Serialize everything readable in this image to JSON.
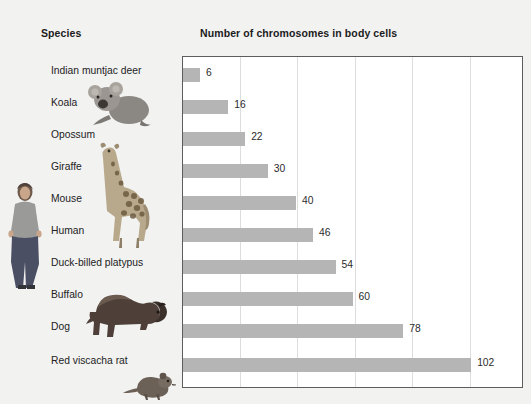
{
  "headers": {
    "species": "Species",
    "chart": "Number of chromosomes in body cells"
  },
  "chart_data": {
    "type": "bar",
    "orientation": "horizontal",
    "title": "Number of chromosomes in body cells",
    "xlabel": "",
    "ylabel": "Species",
    "categories": [
      "Indian muntjac deer",
      "Koala",
      "Opossum",
      "Giraffe",
      "Mouse",
      "Human",
      "Duck-billed platypus",
      "Buffalo",
      "Dog",
      "Red viscacha rat"
    ],
    "values": [
      6,
      16,
      22,
      30,
      40,
      46,
      54,
      60,
      78,
      102
    ],
    "value_labels": [
      "6",
      "16",
      "22",
      "30",
      "40",
      "46",
      "54",
      "60",
      "78",
      "102"
    ],
    "xlim": [
      0,
      120
    ],
    "gridlines": [
      20,
      40,
      60,
      80,
      100
    ],
    "grid": true,
    "legend": "none",
    "bar_color": "#b5b5b5",
    "panel_border_color": "#5d5d5d",
    "gridline_color": "#dddddd",
    "background_color": "#f2f2f1"
  },
  "illustrations": [
    {
      "name": "human-photo",
      "label": "Human"
    },
    {
      "name": "koala-photo",
      "label": "Koala"
    },
    {
      "name": "giraffe-photo",
      "label": "Giraffe"
    },
    {
      "name": "buffalo-photo",
      "label": "Buffalo"
    },
    {
      "name": "rat-photo",
      "label": "Red viscacha rat"
    }
  ]
}
